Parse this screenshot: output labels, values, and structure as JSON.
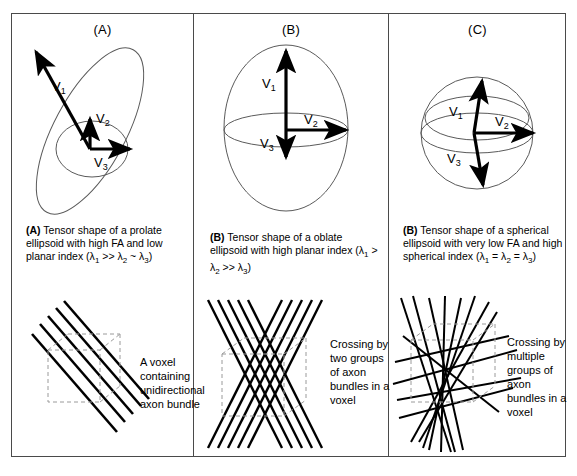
{
  "figure": {
    "panels": [
      {
        "letter": "(A)",
        "shape": "prolate-ellipsoid",
        "vectors": [
          "V1",
          "V2",
          "V3"
        ],
        "vector_labels": {
          "v1": "V",
          "v1sub": "1",
          "v2": "V",
          "v2sub": "2",
          "v3": "V",
          "v3sub": "3"
        },
        "caption_tag": "(A)",
        "caption_text": "Tensor shape of a prolate ellipsoid with high FA and low planar index (λ",
        "caption_full": "(A) Tensor shape of a prolate ellipsoid with high FA and low planar index (λ1 >> λ2 ~ λ3)",
        "caption_sub1": "1",
        "caption_mid": " >> λ",
        "caption_sub2": "2",
        "caption_mid2": " ~ λ",
        "caption_sub3": "3",
        "caption_end": ")",
        "bottom_label": "A voxel containing unidirectional axon bundle",
        "bottom_diagram": "unidirectional-axon-bundle"
      },
      {
        "letter": "(B)",
        "shape": "oblate-ellipsoid",
        "vectors": [
          "V1",
          "V2",
          "V3"
        ],
        "caption_tag": "(B)",
        "caption_text": "Tensor shape of a oblate ellipsoid with high planar index (λ",
        "caption_full": "(B) Tensor shape of a oblate ellipsoid with high planar index (λ1 > λ2 >> λ3)",
        "caption_sub1": "1",
        "caption_mid": " > λ",
        "caption_sub2": "2",
        "caption_mid2": " >> λ",
        "caption_sub3": "3",
        "caption_end": ")",
        "bottom_label": "Crossing by two groups of axon bundles in a voxel",
        "bottom_diagram": "two-crossing-axon-bundles"
      },
      {
        "letter": "(C)",
        "shape": "spherical-ellipsoid",
        "vectors": [
          "V1",
          "V2",
          "V3"
        ],
        "caption_tag": "(B)",
        "caption_text": "Tensor shape of a spherical ellipsoid with very low FA and high spherical index (λ",
        "caption_full": "(B) Tensor shape of a spherical ellipsoid with very low FA and high spherical index (λ1 = λ2 = λ3)",
        "caption_sub1": "1",
        "caption_mid": " = λ",
        "caption_sub2": "2",
        "caption_mid2": " = λ",
        "caption_sub3": "3",
        "caption_end": ")",
        "bottom_label": "Crossing by multiple groups of axon bundles in a voxel",
        "bottom_diagram": "multiple-crossing-axon-bundles"
      }
    ],
    "colors": {
      "stroke": "#000000",
      "outline": "#5a5a5a",
      "dashed": "#8a8a8a",
      "border": "#4a4a4a",
      "background": "#ffffff"
    }
  }
}
